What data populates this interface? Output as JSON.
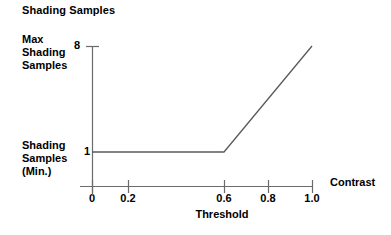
{
  "chart_data": {
    "type": "line",
    "title": "Shading Samples",
    "xlabel": "Threshold",
    "ylabel": "Shading Samples",
    "x_axis_name": "Contrast",
    "xlim": [
      0.0,
      1.0
    ],
    "ylim": [
      1,
      8
    ],
    "grid": false,
    "legend": null,
    "x_ticks": [
      {
        "value": 0.0,
        "label": "0"
      },
      {
        "value": 0.2,
        "label": "0.2"
      },
      {
        "value": 0.6,
        "label": "0.6"
      },
      {
        "value": 0.8,
        "label": "0.8"
      },
      {
        "value": 1.0,
        "label": "1.0"
      }
    ],
    "y_ticks": [
      {
        "value": 1,
        "label": "1"
      },
      {
        "value": 8,
        "label": "8"
      }
    ],
    "y_tick_annotations": [
      {
        "value": 8,
        "label": "Max\nShading\nSamples"
      },
      {
        "value": 1,
        "label": "Shading\nSamples\n(Min.)"
      }
    ],
    "series": [
      {
        "name": "shading samples vs contrast",
        "x": [
          0.0,
          0.6,
          1.0
        ],
        "values": [
          1,
          1,
          8
        ]
      }
    ],
    "annotations": {
      "knee_point": {
        "x": 0.6,
        "y": 1
      },
      "end_point": {
        "x": 1.0,
        "y": 8
      }
    }
  },
  "labels": {
    "title": "Shading Samples",
    "y_max_line1": "Max",
    "y_max_line2": "Shading",
    "y_max_line3": "Samples",
    "y_min_line1": "Shading",
    "y_min_line2": "Samples",
    "y_min_line3": "(Min.)",
    "y_tick_top": "8",
    "y_tick_bottom": "1",
    "x_tick_0": "0",
    "x_tick_02": "0.2",
    "x_tick_06": "0.6",
    "x_tick_08": "0.8",
    "x_tick_10": "1.0",
    "x_axis_title": "Threshold",
    "x_axis_variable": "Contrast"
  },
  "colors": {
    "background": "#ffffff",
    "axis": "#6b6b6b",
    "data_line": "#5a5a5a",
    "text": "#000000"
  }
}
